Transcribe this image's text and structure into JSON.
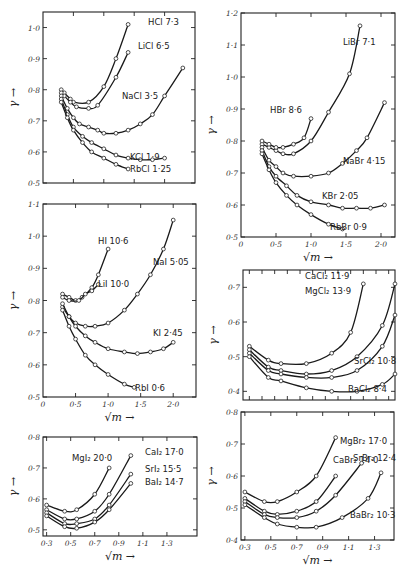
{
  "figure": {
    "y_axis_symbol": "γ",
    "x_axis_symbol": "√m",
    "arrow": "→"
  },
  "chart_data": [
    {
      "id": "chlorides-1",
      "type": "line",
      "title": "",
      "xlabel": "√m",
      "ylabel": "γ",
      "box": {
        "x0": 43,
        "y0": 12,
        "x1": 195,
        "y1": 183
      },
      "xlim": [
        0,
        2.5
      ],
      "ylim": [
        0.5,
        1.05
      ],
      "xticks": [
        0.5,
        1.0,
        1.5,
        2.0
      ],
      "xtick_labels": [],
      "yticks": [
        0.5,
        0.6,
        0.7,
        0.8,
        0.9,
        1.0
      ],
      "ytick_labels": [
        "0·5",
        "0·6",
        "0·7",
        "0·8",
        "0·9",
        "1·0"
      ],
      "series": [
        {
          "name": "HCl",
          "label": "HCl 7·3",
          "label_pos": [
            148,
            25
          ],
          "x": [
            0.3,
            0.35,
            0.45,
            0.5,
            0.75,
            1.0,
            1.2,
            1.4
          ],
          "y": [
            0.8,
            0.79,
            0.77,
            0.76,
            0.76,
            0.81,
            0.9,
            1.01
          ]
        },
        {
          "name": "LiCl",
          "label": "LiCl 6·5",
          "label_pos": [
            138,
            49
          ],
          "x": [
            0.3,
            0.35,
            0.45,
            0.55,
            0.75,
            0.9,
            1.2,
            1.4
          ],
          "y": [
            0.79,
            0.78,
            0.76,
            0.745,
            0.74,
            0.75,
            0.84,
            0.92
          ]
        },
        {
          "name": "NaCl",
          "label": "NaCl 3·5",
          "label_pos": [
            122,
            99
          ],
          "x": [
            0.3,
            0.4,
            0.5,
            0.6,
            0.75,
            0.9,
            1.0,
            1.2,
            1.4,
            1.6,
            1.8,
            2.0,
            2.3
          ],
          "y": [
            0.78,
            0.74,
            0.71,
            0.69,
            0.68,
            0.67,
            0.66,
            0.66,
            0.67,
            0.69,
            0.72,
            0.78,
            0.87
          ]
        },
        {
          "name": "KCl",
          "label": "KCl 1·9",
          "label_pos": [
            130,
            160
          ],
          "x": [
            0.3,
            0.4,
            0.5,
            0.65,
            0.8,
            1.0,
            1.2,
            1.4,
            1.6,
            1.8,
            2.0
          ],
          "y": [
            0.77,
            0.72,
            0.68,
            0.65,
            0.63,
            0.61,
            0.59,
            0.58,
            0.575,
            0.575,
            0.58
          ]
        },
        {
          "name": "RbCl",
          "label": "RbCl 1·25",
          "label_pos": [
            130,
            172
          ],
          "x": [
            0.3,
            0.4,
            0.5,
            0.65,
            0.8,
            1.0,
            1.2,
            1.4
          ],
          "y": [
            0.76,
            0.71,
            0.67,
            0.63,
            0.6,
            0.58,
            0.56,
            0.545
          ]
        }
      ]
    },
    {
      "id": "bromides",
      "type": "line",
      "title": "",
      "xlabel": "√m",
      "ylabel": "γ",
      "box": {
        "x0": 241,
        "y0": 13,
        "x1": 395,
        "y1": 237
      },
      "xlim": [
        0,
        2.2
      ],
      "ylim": [
        0.5,
        1.2
      ],
      "xticks": [
        0.5,
        1.0,
        1.5,
        2.0
      ],
      "xtick_labels": [
        "0",
        "0·5",
        "1·0",
        "1·5",
        "2·0"
      ],
      "yticks": [
        0.5,
        0.6,
        0.7,
        0.8,
        0.9,
        1.0,
        1.1,
        1.2
      ],
      "ytick_labels": [
        "0·5",
        "0·6",
        "0·7",
        "0·8",
        "0·9",
        "1·0",
        "1·1",
        "1·2"
      ],
      "series": [
        {
          "name": "LiBr",
          "label": "LiBr 7·1",
          "label_pos": [
            343,
            45
          ],
          "x": [
            0.3,
            0.4,
            0.5,
            0.6,
            0.75,
            1.0,
            1.25,
            1.55,
            1.7
          ],
          "y": [
            0.79,
            0.78,
            0.77,
            0.76,
            0.76,
            0.8,
            0.89,
            1.01,
            1.16
          ]
        },
        {
          "name": "HBr",
          "label": "HBr 8·6",
          "label_pos": [
            270,
            113
          ],
          "x": [
            0.3,
            0.4,
            0.5,
            0.6,
            0.75,
            0.9,
            1.0
          ],
          "y": [
            0.8,
            0.79,
            0.78,
            0.78,
            0.79,
            0.81,
            0.87
          ]
        },
        {
          "name": "NaBr",
          "label": "NaBr 4·15",
          "label_pos": [
            343,
            164
          ],
          "x": [
            0.3,
            0.4,
            0.5,
            0.6,
            0.75,
            1.0,
            1.25,
            1.45,
            1.65,
            1.8,
            2.05
          ],
          "y": [
            0.78,
            0.74,
            0.72,
            0.7,
            0.69,
            0.69,
            0.7,
            0.73,
            0.77,
            0.81,
            0.92
          ]
        },
        {
          "name": "KBr",
          "label": "KBr 2·05",
          "label_pos": [
            322,
            199
          ],
          "x": [
            0.3,
            0.4,
            0.5,
            0.65,
            0.8,
            1.0,
            1.25,
            1.45,
            1.65,
            1.85,
            2.05
          ],
          "y": [
            0.77,
            0.72,
            0.69,
            0.66,
            0.63,
            0.61,
            0.6,
            0.59,
            0.59,
            0.59,
            0.6
          ]
        },
        {
          "name": "RbBr",
          "label": "RbBr 0·9",
          "label_pos": [
            330,
            230
          ],
          "x": [
            0.3,
            0.4,
            0.5,
            0.65,
            0.8,
            1.0,
            1.25,
            1.45
          ],
          "y": [
            0.76,
            0.71,
            0.67,
            0.63,
            0.6,
            0.57,
            0.54,
            0.525
          ]
        }
      ]
    },
    {
      "id": "iodides",
      "type": "line",
      "title": "",
      "xlabel": "√m",
      "ylabel": "γ",
      "box": {
        "x0": 43,
        "y0": 204,
        "x1": 196,
        "y1": 397
      },
      "xlim": [
        0,
        2.35
      ],
      "ylim": [
        0.5,
        1.1
      ],
      "xticks": [
        0.5,
        1.0,
        1.5,
        2.0
      ],
      "xtick_labels": [
        "0",
        "0·5",
        "1·0",
        "1·5",
        "2·0"
      ],
      "yticks": [
        0.5,
        0.6,
        0.7,
        0.8,
        0.9,
        1.0,
        1.1
      ],
      "ytick_labels": [
        "0·5",
        "0·6",
        "0·7",
        "0·8",
        "0·9",
        "1·0",
        "1·1"
      ],
      "series": [
        {
          "name": "HI",
          "label": "HI 10·6",
          "label_pos": [
            98,
            244
          ],
          "x": [
            0.3,
            0.4,
            0.5,
            0.6,
            0.75,
            0.85,
            1.0
          ],
          "y": [
            0.82,
            0.81,
            0.8,
            0.81,
            0.84,
            0.88,
            0.96
          ]
        },
        {
          "name": "LiI",
          "label": "LiI 10·0",
          "label_pos": [
            98,
            287
          ],
          "x": [
            0.3,
            0.4,
            0.55,
            0.65,
            0.75,
            0.85
          ],
          "y": [
            0.81,
            0.8,
            0.8,
            0.82,
            0.83,
            0.85
          ]
        },
        {
          "name": "NaI",
          "label": "NaI 5·05",
          "label_pos": [
            153,
            265
          ],
          "x": [
            0.3,
            0.4,
            0.5,
            0.65,
            0.8,
            1.0,
            1.25,
            1.45,
            1.65,
            1.85,
            2.0
          ],
          "y": [
            0.78,
            0.75,
            0.73,
            0.72,
            0.72,
            0.73,
            0.77,
            0.82,
            0.88,
            0.96,
            1.05
          ]
        },
        {
          "name": "KI",
          "label": "KI 2·45",
          "label_pos": [
            153,
            336
          ],
          "x": [
            0.3,
            0.4,
            0.5,
            0.65,
            0.8,
            1.0,
            1.25,
            1.45,
            1.65,
            1.85,
            2.0
          ],
          "y": [
            0.79,
            0.75,
            0.72,
            0.69,
            0.67,
            0.65,
            0.64,
            0.635,
            0.64,
            0.65,
            0.67
          ]
        },
        {
          "name": "RbI",
          "label": "RbI 0·6",
          "label_pos": [
            135,
            391
          ],
          "x": [
            0.3,
            0.4,
            0.5,
            0.65,
            0.8,
            1.0,
            1.25,
            1.4
          ],
          "y": [
            0.77,
            0.72,
            0.68,
            0.63,
            0.6,
            0.57,
            0.54,
            0.53
          ]
        }
      ]
    },
    {
      "id": "alkaline-earth-chlorides",
      "type": "line",
      "title": "",
      "xlabel": "√m",
      "ylabel": "γ",
      "box": {
        "x0": 243,
        "y0": 270,
        "x1": 395,
        "y1": 400
      },
      "xlim": [
        0.25,
        1.45
      ],
      "ylim": [
        0.375,
        0.75
      ],
      "xticks": [
        0.3,
        0.4,
        0.5,
        0.6,
        0.7,
        0.8,
        0.9,
        1.0,
        1.1,
        1.2,
        1.3,
        1.4
      ],
      "xtick_labels": [],
      "yticks": [
        0.4,
        0.5,
        0.6,
        0.7
      ],
      "ytick_labels": [
        "0·4",
        "0·5",
        "0·6",
        "0·7"
      ],
      "series": [
        {
          "name": "CaCl2",
          "label": "CaCl₂ 11·9",
          "label_pos": [
            305,
            279
          ],
          "x": [
            0.3,
            0.45,
            0.55,
            0.75,
            0.95,
            1.1,
            1.2
          ],
          "y": [
            0.53,
            0.49,
            0.48,
            0.48,
            0.51,
            0.57,
            0.71
          ]
        },
        {
          "name": "MgCl2",
          "label": "MgCl₂ 13·9",
          "label_pos": [
            305,
            294
          ],
          "x": [
            0.3,
            0.45,
            0.55,
            0.75,
            0.95,
            1.15,
            1.35,
            1.45
          ],
          "y": [
            0.52,
            0.47,
            0.46,
            0.45,
            0.46,
            0.5,
            0.59,
            0.71
          ]
        },
        {
          "name": "SrCl2",
          "label": "SrCl₂ 10·8",
          "label_pos": [
            354,
            364
          ],
          "x": [
            0.3,
            0.45,
            0.55,
            0.75,
            0.95,
            1.15,
            1.35,
            1.45
          ],
          "y": [
            0.51,
            0.46,
            0.45,
            0.44,
            0.44,
            0.46,
            0.53,
            0.62
          ]
        },
        {
          "name": "BaCl2",
          "label": "BaCl₂ 8·4",
          "label_pos": [
            348,
            392
          ],
          "x": [
            0.3,
            0.45,
            0.55,
            0.75,
            0.95,
            1.15,
            1.35,
            1.45
          ],
          "y": [
            0.5,
            0.44,
            0.43,
            0.41,
            0.4,
            0.4,
            0.42,
            0.45
          ]
        }
      ]
    },
    {
      "id": "alkaline-earth-iodides",
      "type": "line",
      "title": "",
      "xlabel": "√m",
      "ylabel": "γ",
      "box": {
        "x0": 43,
        "y0": 437,
        "x1": 197,
        "y1": 536
      },
      "xlim": [
        0.27,
        1.55
      ],
      "ylim": [
        0.48,
        0.8
      ],
      "xticks": [
        0.3,
        0.5,
        0.7,
        0.9,
        1.1,
        1.3
      ],
      "xtick_labels": [
        "0·3",
        "0·5",
        "0·7",
        "0·9",
        "1·1",
        "1·3"
      ],
      "yticks": [
        0.5,
        0.6,
        0.7,
        0.8
      ],
      "ytick_labels": [
        "0·5",
        "0·6",
        "0·7",
        "0·8"
      ],
      "series": [
        {
          "name": "MgI2",
          "label": "MgI₂ 20·0",
          "label_pos": [
            72,
            461
          ],
          "x": [
            0.3,
            0.45,
            0.55,
            0.7,
            0.82
          ],
          "y": [
            0.58,
            0.56,
            0.565,
            0.615,
            0.7
          ]
        },
        {
          "name": "CaI2",
          "label": "CaI₂ 17·0",
          "label_pos": [
            145,
            455
          ],
          "x": [
            0.3,
            0.45,
            0.55,
            0.7,
            0.82,
            1.0
          ],
          "y": [
            0.565,
            0.535,
            0.535,
            0.56,
            0.615,
            0.74
          ]
        },
        {
          "name": "SrI2",
          "label": "SrI₂ 15·5",
          "label_pos": [
            145,
            472
          ],
          "x": [
            0.3,
            0.45,
            0.55,
            0.7,
            0.82,
            1.0
          ],
          "y": [
            0.555,
            0.52,
            0.52,
            0.535,
            0.58,
            0.68
          ]
        },
        {
          "name": "BaI2",
          "label": "BaI₂ 14·7",
          "label_pos": [
            145,
            485
          ],
          "x": [
            0.3,
            0.45,
            0.55,
            0.7,
            0.82,
            1.0
          ],
          "y": [
            0.545,
            0.51,
            0.505,
            0.525,
            0.565,
            0.65
          ]
        }
      ]
    },
    {
      "id": "alkaline-earth-bromides",
      "type": "line",
      "title": "",
      "xlabel": "√m",
      "ylabel": "γ",
      "box": {
        "x0": 241,
        "y0": 412,
        "x1": 394,
        "y1": 540
      },
      "xlim": [
        0.27,
        1.45
      ],
      "ylim": [
        0.4,
        0.8
      ],
      "xticks": [
        0.3,
        0.5,
        0.7,
        0.9,
        1.1,
        1.3
      ],
      "xtick_labels": [
        "0·3",
        "0·5",
        "0·7",
        "0·9",
        "1·1",
        "1·3"
      ],
      "yticks": [
        0.4,
        0.5,
        0.6,
        0.7,
        0.8
      ],
      "ytick_labels": [
        "0·4",
        "0·5",
        "0·6",
        "0·7",
        "0·8"
      ],
      "series": [
        {
          "name": "MgBr2",
          "label": "MgBr₂ 17·0",
          "label_pos": [
            340,
            444
          ],
          "x": [
            0.3,
            0.45,
            0.55,
            0.7,
            0.85,
            1.0
          ],
          "y": [
            0.55,
            0.52,
            0.52,
            0.55,
            0.6,
            0.72
          ]
        },
        {
          "name": "CaBr2",
          "label": "CaBr₂ 14·0",
          "label_pos": [
            333,
            463
          ],
          "x": [
            0.3,
            0.45,
            0.55,
            0.7,
            0.85,
            1.0
          ],
          "y": [
            0.53,
            0.49,
            0.48,
            0.49,
            0.52,
            0.6
          ]
        },
        {
          "name": "SrBr2",
          "label": "SrBr₂ 12·4",
          "label_pos": [
            353,
            461
          ],
          "x": [
            0.3,
            0.45,
            0.55,
            0.7,
            0.85,
            1.0,
            1.2
          ],
          "y": [
            0.52,
            0.48,
            0.47,
            0.47,
            0.49,
            0.54,
            0.64
          ]
        },
        {
          "name": "BaBr2",
          "label": "BaBr₂ 10·3",
          "label_pos": [
            350,
            518
          ],
          "x": [
            0.3,
            0.45,
            0.55,
            0.7,
            0.85,
            1.05,
            1.25,
            1.35
          ],
          "y": [
            0.51,
            0.47,
            0.45,
            0.44,
            0.44,
            0.47,
            0.53,
            0.61
          ]
        }
      ]
    }
  ]
}
